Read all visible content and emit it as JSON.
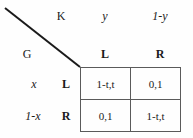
{
  "figure": {
    "type": "normal-form-game-payoff-matrix",
    "row_player": "G",
    "col_player": "K",
    "line_color": "#1a1a1a",
    "border_color": "#5a5a5a",
    "background": "#fefefe"
  },
  "players": {
    "column_label": "K",
    "row_label": "G"
  },
  "column_probabilities": [
    {
      "text": "y"
    },
    {
      "text": "1-y"
    }
  ],
  "column_actions": [
    {
      "text": "L"
    },
    {
      "text": "R"
    }
  ],
  "row_probabilities": [
    {
      "text": "x"
    },
    {
      "text": "1-x"
    }
  ],
  "row_actions": [
    {
      "text": "L"
    },
    {
      "text": "R"
    }
  ],
  "payoffs": {
    "rows": [
      {
        "cells": [
          {
            "text": "1-t,t"
          },
          {
            "text": "0,1"
          }
        ]
      },
      {
        "cells": [
          {
            "text": "0,1"
          },
          {
            "text": "1-t,t"
          }
        ]
      }
    ]
  }
}
